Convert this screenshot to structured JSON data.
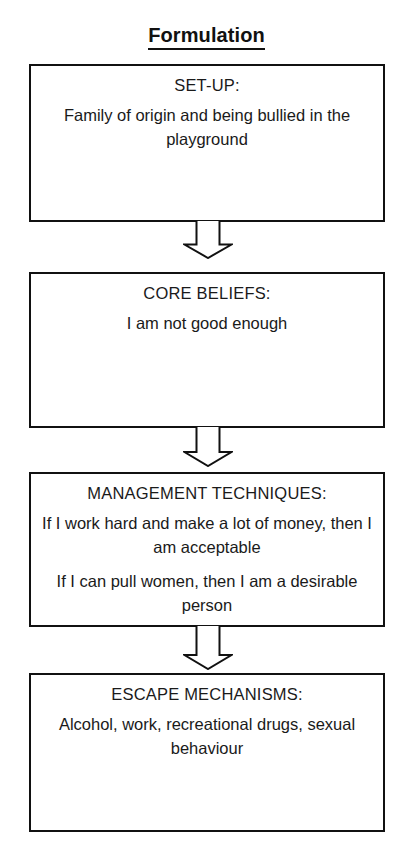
{
  "diagram": {
    "title": "Formulation",
    "background_color": "#ffffff",
    "line_color": "#111111",
    "text_color": "#1a1a1a",
    "nodes": [
      {
        "id": "set-up",
        "heading": "SET-UP:",
        "lines": [
          "Family of origin and being bullied in the playground"
        ]
      },
      {
        "id": "core-beliefs",
        "heading": "CORE BELIEFS:",
        "lines": [
          "I am not good enough"
        ]
      },
      {
        "id": "management-techniques",
        "heading": "MANAGEMENT TECHNIQUES:",
        "lines": [
          "If I work hard and make a lot of money, then I am acceptable",
          "If I can pull women, then I am a desirable person"
        ]
      },
      {
        "id": "escape-mechanisms",
        "heading": "ESCAPE MECHANISMS:",
        "lines": [
          "Alcohol, work, recreational drugs, sexual behaviour"
        ]
      }
    ],
    "connectors": [
      {
        "id": "arrow-1",
        "icon": "down-block-arrow-icon",
        "from": "set-up",
        "to": "core-beliefs"
      },
      {
        "id": "arrow-2",
        "icon": "down-block-arrow-icon",
        "from": "core-beliefs",
        "to": "management-techniques"
      },
      {
        "id": "arrow-3",
        "icon": "down-block-arrow-icon",
        "from": "management-techniques",
        "to": "escape-mechanisms"
      }
    ]
  }
}
